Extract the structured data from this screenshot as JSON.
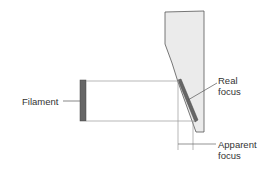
{
  "diagram": {
    "labels": {
      "filament": "Filament",
      "real_focus_line1": "Real",
      "real_focus_line2": "focus",
      "apparent_focus_line1": "Apparent",
      "apparent_focus_line2": "focus"
    },
    "colors": {
      "anode_fill": "#ebebeb",
      "target_fill": "#666666",
      "filament_fill": "#666666",
      "line": "#555555",
      "text": "#333333"
    }
  }
}
